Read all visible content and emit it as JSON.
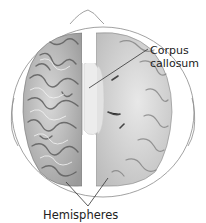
{
  "diagram": {
    "labels": {
      "corpus_callosum_line1": "Corpus",
      "corpus_callosum_line2": "callosum",
      "hemispheres": "Hemispheres"
    },
    "colors": {
      "background": "#ffffff",
      "outline": "#888888",
      "brain_light": "#e6e6e6",
      "brain_mid": "#b5b5b5",
      "brain_dark": "#6e6e6e",
      "callosum": "#ececec",
      "leader_line": "#333333",
      "text": "#222222"
    }
  }
}
